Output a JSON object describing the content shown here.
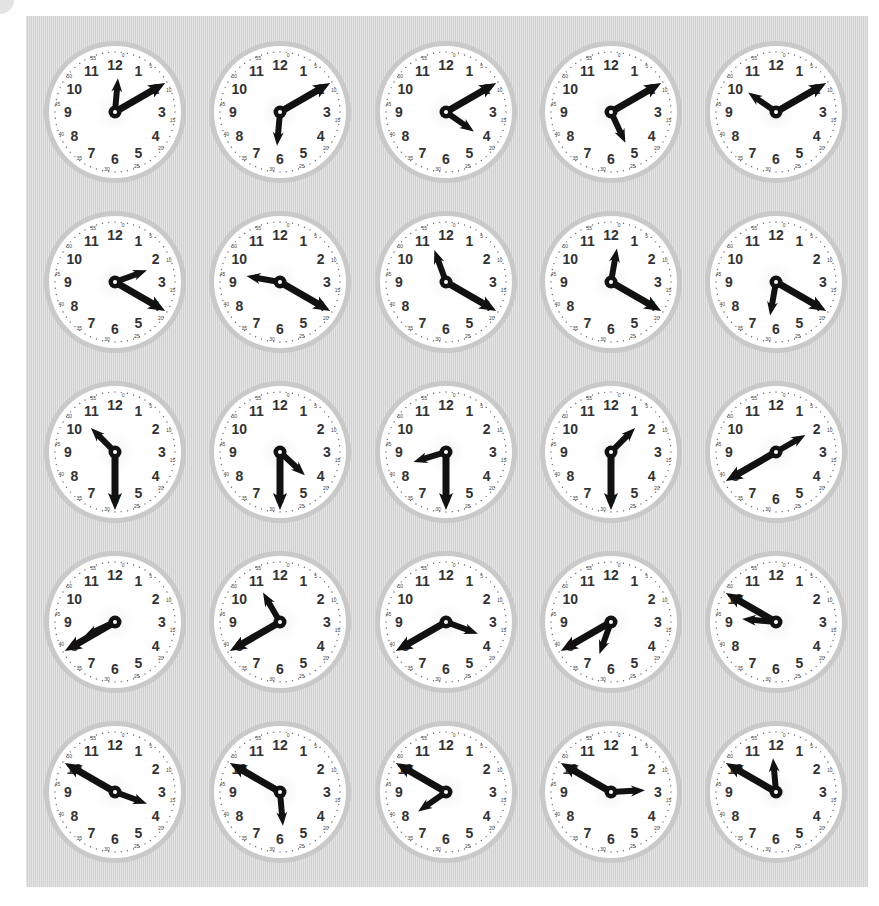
{
  "worksheet": {
    "title": "",
    "panel_color": "#d8d8d8",
    "hand_color": "#111111",
    "face_color": "#ffffff",
    "rim_color": "#c9c9c9",
    "clock_numbers": [
      "12",
      "1",
      "2",
      "3",
      "4",
      "5",
      "6",
      "7",
      "8",
      "9",
      "10",
      "11"
    ],
    "minute_labels": [
      "0",
      "5",
      "10",
      "15",
      "20",
      "25",
      "30",
      "35",
      "40",
      "45",
      "50",
      "55"
    ],
    "column_x": [
      115,
      280,
      446,
      611,
      776
    ],
    "row_y": [
      112,
      282,
      452,
      622,
      792
    ],
    "clocks": [
      {
        "id": 1,
        "row": 0,
        "col": 0,
        "hour_angle": 5,
        "minute_angle": 60
      },
      {
        "id": 2,
        "row": 0,
        "col": 1,
        "hour_angle": 185,
        "minute_angle": 60
      },
      {
        "id": 3,
        "row": 0,
        "col": 2,
        "hour_angle": 125,
        "minute_angle": 60
      },
      {
        "id": 4,
        "row": 0,
        "col": 3,
        "hour_angle": 155,
        "minute_angle": 60
      },
      {
        "id": 5,
        "row": 0,
        "col": 4,
        "hour_angle": 305,
        "minute_angle": 60
      },
      {
        "id": 6,
        "row": 1,
        "col": 0,
        "hour_angle": 70,
        "minute_angle": 120
      },
      {
        "id": 7,
        "row": 1,
        "col": 1,
        "hour_angle": 280,
        "minute_angle": 120
      },
      {
        "id": 8,
        "row": 1,
        "col": 2,
        "hour_angle": 340,
        "minute_angle": 120
      },
      {
        "id": 9,
        "row": 1,
        "col": 3,
        "hour_angle": 10,
        "minute_angle": 120
      },
      {
        "id": 10,
        "row": 1,
        "col": 4,
        "hour_angle": 190,
        "minute_angle": 120
      },
      {
        "id": 11,
        "row": 2,
        "col": 0,
        "hour_angle": 315,
        "minute_angle": 180
      },
      {
        "id": 12,
        "row": 2,
        "col": 1,
        "hour_angle": 133,
        "minute_angle": 180
      },
      {
        "id": 13,
        "row": 2,
        "col": 2,
        "hour_angle": 253,
        "minute_angle": 180
      },
      {
        "id": 14,
        "row": 2,
        "col": 3,
        "hour_angle": 45,
        "minute_angle": 180
      },
      {
        "id": 15,
        "row": 2,
        "col": 4,
        "hour_angle": 60,
        "minute_angle": 240
      },
      {
        "id": 16,
        "row": 3,
        "col": 0,
        "hour_angle": 245,
        "minute_angle": 240
      },
      {
        "id": 17,
        "row": 3,
        "col": 1,
        "hour_angle": 330,
        "minute_angle": 240
      },
      {
        "id": 18,
        "row": 3,
        "col": 2,
        "hour_angle": 110,
        "minute_angle": 240
      },
      {
        "id": 19,
        "row": 3,
        "col": 3,
        "hour_angle": 200,
        "minute_angle": 240
      },
      {
        "id": 20,
        "row": 3,
        "col": 4,
        "hour_angle": 275,
        "minute_angle": 300
      },
      {
        "id": 21,
        "row": 4,
        "col": 0,
        "hour_angle": 110,
        "minute_angle": 300
      },
      {
        "id": 22,
        "row": 4,
        "col": 1,
        "hour_angle": 175,
        "minute_angle": 300
      },
      {
        "id": 23,
        "row": 4,
        "col": 2,
        "hour_angle": 235,
        "minute_angle": 300
      },
      {
        "id": 24,
        "row": 4,
        "col": 3,
        "hour_angle": 87,
        "minute_angle": 300
      },
      {
        "id": 25,
        "row": 4,
        "col": 4,
        "hour_angle": 355,
        "minute_angle": 300
      }
    ]
  }
}
